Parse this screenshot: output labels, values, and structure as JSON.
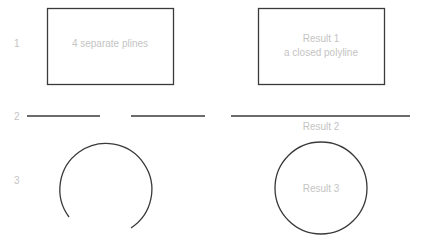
{
  "rows": [
    {
      "number": "1",
      "left_label": "4 separate plines",
      "right_label_line1": "Result 1",
      "right_label_line2": "a closed polyline"
    },
    {
      "number": "2",
      "right_label": "Result 2"
    },
    {
      "number": "3",
      "right_label": "Result 3"
    }
  ],
  "colors": {
    "stroke": "#3a3a3a",
    "label": "#c4c4c4",
    "background": "#ffffff"
  }
}
